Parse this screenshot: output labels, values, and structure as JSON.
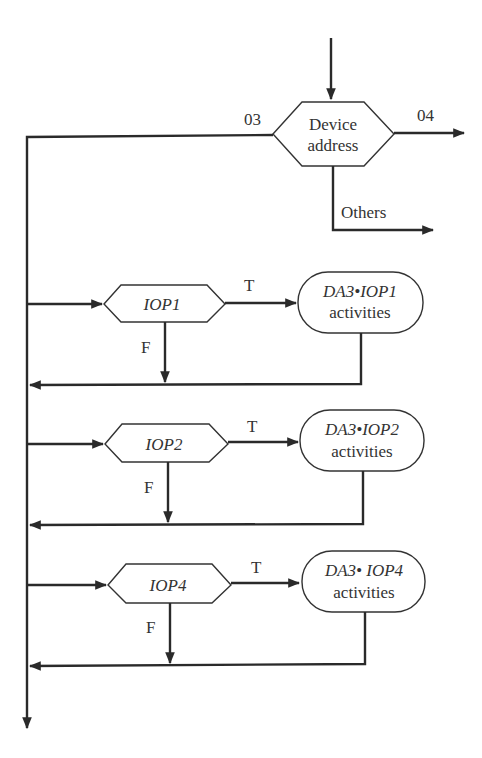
{
  "diagram": {
    "type": "flowchart",
    "colors": {
      "line": "#2a2a2a",
      "text": "#333333",
      "background": "#ffffff"
    },
    "entry": {
      "decision": {
        "line1": "Device",
        "line2": "address"
      },
      "outputs": {
        "left": "03",
        "right": "04",
        "bottom": "Others"
      }
    },
    "branches": [
      {
        "test": "IOP1",
        "true_label": "T",
        "false_label": "F",
        "action_line1": "DA3•IOP1",
        "action_line2": "activities"
      },
      {
        "test": "IOP2",
        "true_label": "T",
        "false_label": "F",
        "action_line1": "DA3•IOP2",
        "action_line2": "activities"
      },
      {
        "test": "IOP4",
        "true_label": "T",
        "false_label": "F",
        "action_line1": "DA3• IOP4",
        "action_line2": "activities"
      }
    ]
  }
}
